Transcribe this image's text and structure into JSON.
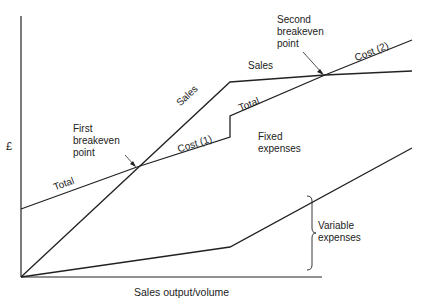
{
  "diagram": {
    "type": "breakeven-chart",
    "axes": {
      "y_label": "£",
      "x_label": "Sales output/volume"
    },
    "lines": {
      "sales": {
        "label_lower": "Sales",
        "label_upper": "Sales",
        "points": [
          [
            21,
            277
          ],
          [
            230,
            82
          ],
          [
            325,
            75
          ],
          [
            412,
            71
          ]
        ]
      },
      "total_cost": {
        "label_lower": "Total",
        "label_cost1": "Cost (1)",
        "label_upper": "Total",
        "label_cost2": "Cost (2)",
        "points": [
          [
            21,
            209
          ],
          [
            137,
            167
          ],
          [
            230,
            137
          ],
          [
            230,
            116
          ],
          [
            325,
            75
          ],
          [
            412,
            40
          ]
        ]
      },
      "variable_cost": {
        "points": [
          [
            21,
            277
          ],
          [
            230,
            247
          ],
          [
            412,
            148
          ]
        ]
      }
    },
    "annotations": {
      "first_breakeven": "First\nbreakeven\npoint",
      "second_breakeven": "Second\nbreakeven\npoint",
      "fixed_expenses": "Fixed\nexpenses",
      "variable_expenses": "Variable\nexpenses"
    },
    "colors": {
      "line": "#222222",
      "background": "#ffffff"
    }
  }
}
